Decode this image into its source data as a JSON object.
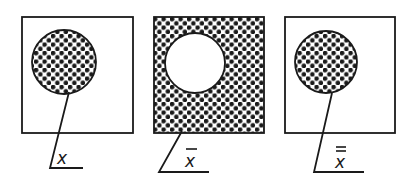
{
  "diagram": {
    "colors": {
      "ink": "#1a1a1a",
      "background": "#ffffff"
    },
    "panels": [
      {
        "id": "set",
        "label": "x",
        "overbars": 0,
        "box": {
          "x": 22,
          "y": 17,
          "w": 111,
          "h": 116
        },
        "circle": {
          "cx": 64,
          "cy": 62,
          "r": 32,
          "shaded": true
        },
        "box_shaded": false,
        "leader": [
          [
            69,
            92
          ],
          [
            50,
            168
          ],
          [
            83,
            168
          ]
        ],
        "label_pos": [
          58,
          164
        ]
      },
      {
        "id": "complement",
        "label": "x",
        "overbars": 1,
        "box": {
          "x": 154,
          "y": 17,
          "w": 110,
          "h": 116
        },
        "circle": {
          "cx": 195,
          "cy": 63,
          "r": 30,
          "shaded": false
        },
        "box_shaded": true,
        "leader": [
          [
            182,
            130
          ],
          [
            159,
            172
          ],
          [
            209,
            172
          ]
        ],
        "label_pos": [
          186,
          166
        ]
      },
      {
        "id": "double-complement",
        "label": "x",
        "overbars": 2,
        "box": {
          "x": 285,
          "y": 17,
          "w": 110,
          "h": 116
        },
        "circle": {
          "cx": 326,
          "cy": 62,
          "r": 31,
          "shaded": true
        },
        "box_shaded": false,
        "leader": [
          [
            332,
            93
          ],
          [
            314,
            172
          ],
          [
            364,
            172
          ]
        ],
        "label_pos": [
          334,
          167
        ]
      }
    ]
  }
}
